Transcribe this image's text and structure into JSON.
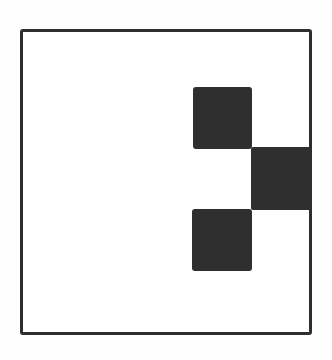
{
  "diagram": {
    "type": "grid-pattern",
    "frame": {
      "shape": "square",
      "border_color": "#2e2e2e",
      "fill_color": "#ffffff"
    },
    "filled_cells": [
      {
        "name": "top",
        "position": "upper-right-inner",
        "color": "#2f2f2f"
      },
      {
        "name": "middle",
        "position": "right-edge",
        "color": "#2f2f2f"
      },
      {
        "name": "bottom",
        "position": "lower-right-inner",
        "color": "#2f2f2f"
      }
    ],
    "colors": {
      "background": "#fefefe",
      "ink": "#2f2f2f"
    }
  }
}
